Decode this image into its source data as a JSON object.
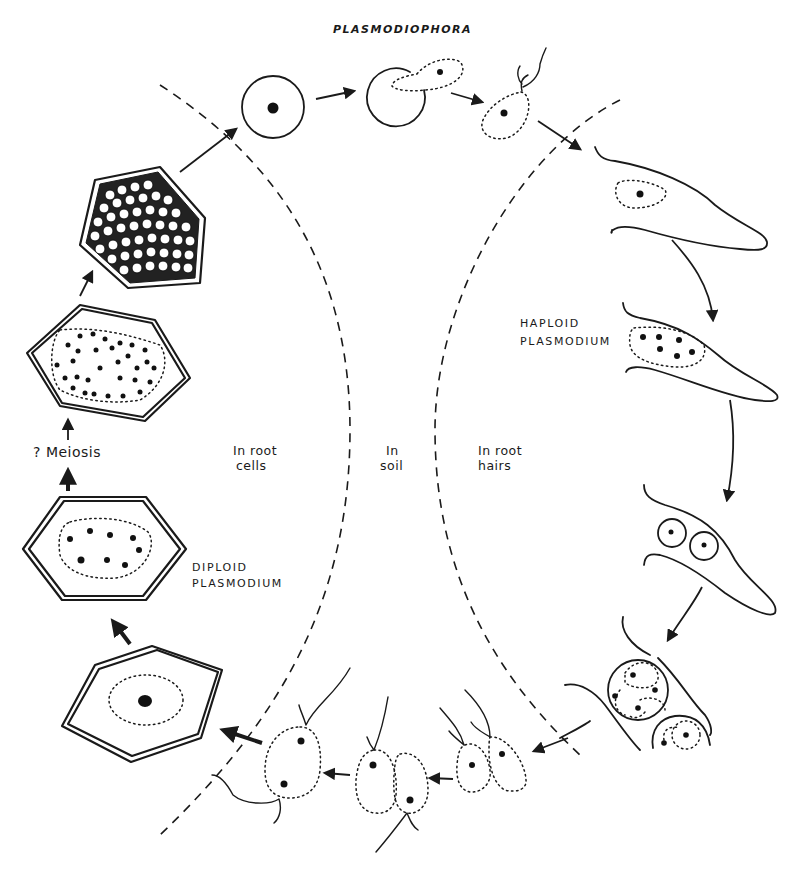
{
  "figure": {
    "title": "PLASMODIOPHORA",
    "regions": {
      "root_cells": {
        "line1": "In root",
        "line2": "cells"
      },
      "soil": {
        "line1": "In",
        "line2": "soil"
      },
      "root_hairs": {
        "line1": "In root",
        "line2": "hairs"
      }
    },
    "labels": {
      "haploid": {
        "line1": "HAPLOID",
        "line2": "PLASMODIUM"
      },
      "diploid": {
        "line1": "DIPLOID",
        "line2": "PLASMODIUM"
      },
      "meiosis": "? Meiosis"
    },
    "stages": [
      "resting spore",
      "germinating spore",
      "biflagellate zoospore",
      "zoospore in root hair",
      "haploid plasmodium in root hair",
      "zoosporangia in root hair",
      "zoosporangia cluster",
      "released zoospores",
      "fusing gametes",
      "zygote (biflagellate)",
      "uninucleate root cell",
      "diploid plasmodium",
      "multinucleate plasmodium after meiosis",
      "root cell filled with spores"
    ],
    "colors": {
      "ink": "#1a1a1a",
      "paper": "#ffffff"
    }
  }
}
